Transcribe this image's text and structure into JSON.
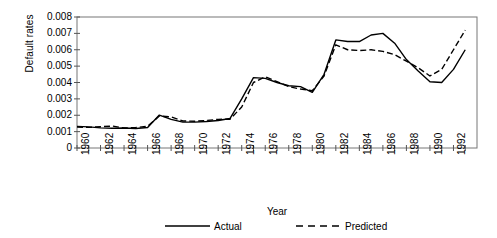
{
  "chart_data": {
    "type": "line",
    "title": "",
    "xlabel": "Year",
    "ylabel": "Default rates",
    "xlim": [
      1960,
      1994
    ],
    "ylim": [
      0,
      0.008
    ],
    "grid": false,
    "legend_position": "bottom",
    "ytick_labels": [
      "0.008",
      "0.007",
      "0.006",
      "0.005",
      "0.004",
      "0.003",
      "0.002",
      "0.001",
      "0"
    ],
    "ytick_values": [
      0.008,
      0.007,
      0.006,
      0.005,
      0.004,
      0.003,
      0.002,
      0.001,
      0
    ],
    "xtick_labels": [
      "1960",
      "1962",
      "1964",
      "1966",
      "1968",
      "1970",
      "1972",
      "1974",
      "1976",
      "1978",
      "1980",
      "1982",
      "1984",
      "1986",
      "1988",
      "1990",
      "1992"
    ],
    "xtick_values": [
      1960,
      1962,
      1964,
      1966,
      1968,
      1970,
      1972,
      1974,
      1976,
      1978,
      1980,
      1982,
      1984,
      1986,
      1988,
      1990,
      1992
    ],
    "x": [
      1960,
      1961,
      1962,
      1963,
      1964,
      1965,
      1966,
      1967,
      1968,
      1969,
      1970,
      1971,
      1972,
      1973,
      1974,
      1975,
      1976,
      1977,
      1978,
      1979,
      1980,
      1981,
      1982,
      1983,
      1984,
      1985,
      1986,
      1987,
      1988,
      1989,
      1990,
      1991,
      1992,
      1993
    ],
    "series": [
      {
        "name": "Actual",
        "style": "solid",
        "color": "#000000",
        "values": [
          0.00132,
          0.00129,
          0.00123,
          0.00121,
          0.00122,
          0.00119,
          0.00125,
          0.00201,
          0.00175,
          0.00158,
          0.00158,
          0.00162,
          0.00168,
          0.0018,
          0.003,
          0.0043,
          0.00425,
          0.004,
          0.0038,
          0.00375,
          0.0034,
          0.0045,
          0.0066,
          0.0065,
          0.0065,
          0.0069,
          0.007,
          0.0064,
          0.0054,
          0.0047,
          0.00405,
          0.004,
          0.0048,
          0.006
        ]
      },
      {
        "name": "Predicted",
        "style": "dashed",
        "color": "#000000",
        "values": [
          0.00128,
          0.00126,
          0.0013,
          0.00134,
          0.00122,
          0.00125,
          0.00133,
          0.00195,
          0.0019,
          0.00165,
          0.00163,
          0.00168,
          0.00175,
          0.00176,
          0.0025,
          0.004,
          0.00435,
          0.00405,
          0.00375,
          0.0036,
          0.0035,
          0.0044,
          0.0063,
          0.006,
          0.00595,
          0.006,
          0.0059,
          0.0057,
          0.0053,
          0.0049,
          0.0044,
          0.0048,
          0.006,
          0.0072
        ]
      }
    ]
  },
  "legend": {
    "items": [
      {
        "label": "Actual",
        "style": "solid"
      },
      {
        "label": "Predicted",
        "style": "dashed"
      }
    ]
  }
}
